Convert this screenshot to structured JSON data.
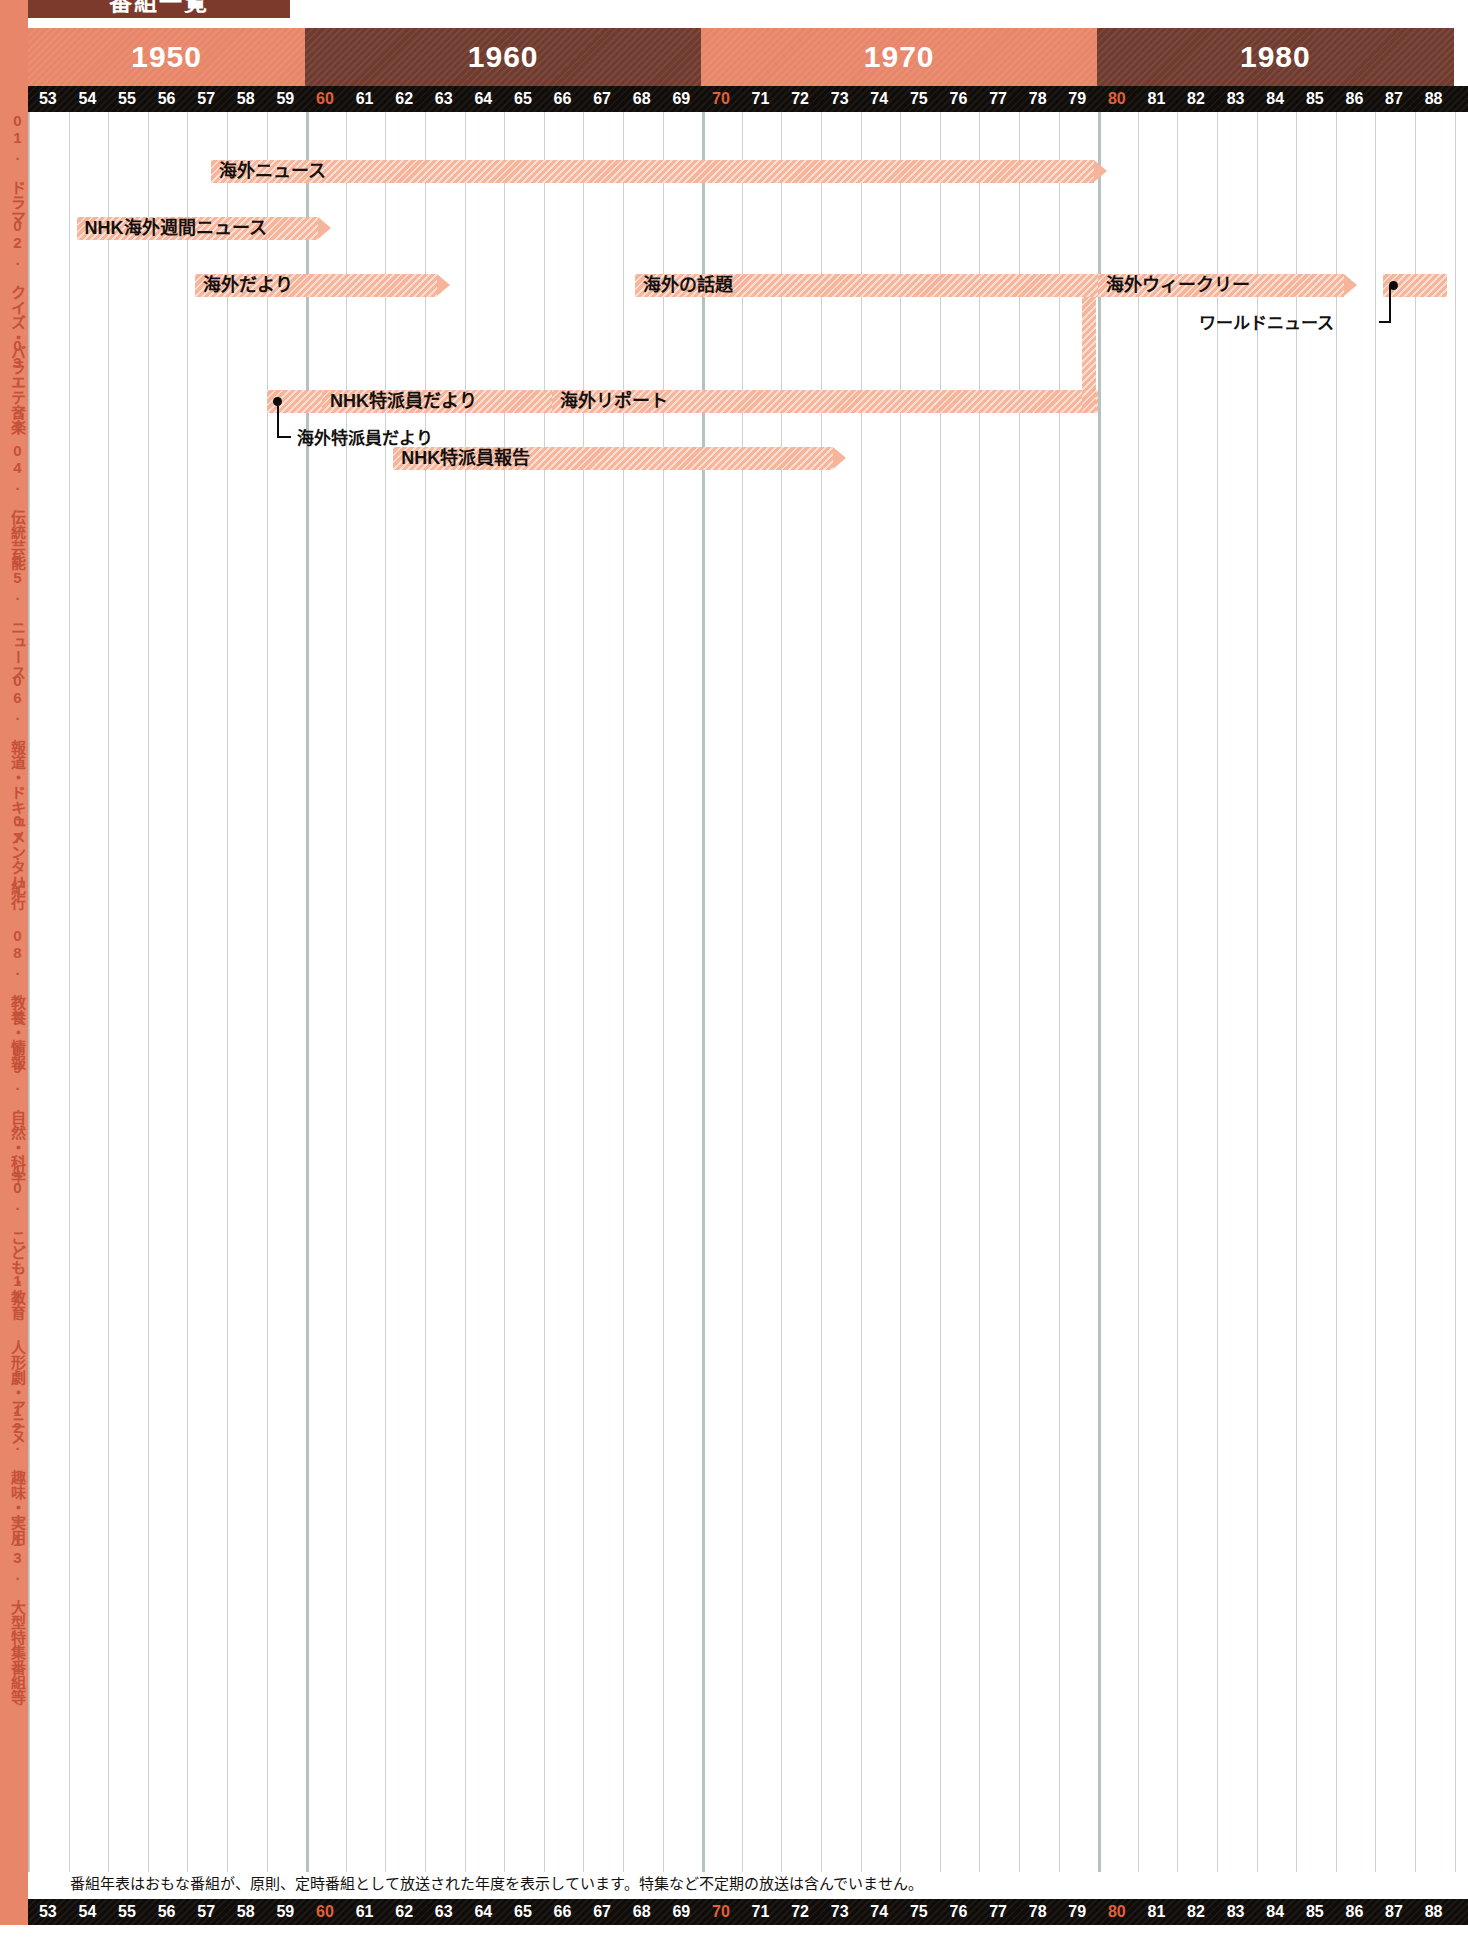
{
  "header": {
    "title": "番組一覧",
    "decades": [
      "1950",
      "1960",
      "1970",
      "1980"
    ],
    "highlight_color": "#e2603a",
    "band_color_a": "#e8866a",
    "band_color_b": "#6f3b2e"
  },
  "axis": {
    "years": [
      "53",
      "54",
      "55",
      "56",
      "57",
      "58",
      "59",
      "60",
      "61",
      "62",
      "63",
      "64",
      "65",
      "66",
      "67",
      "68",
      "69",
      "70",
      "71",
      "72",
      "73",
      "74",
      "75",
      "76",
      "77",
      "78",
      "79",
      "80",
      "81",
      "82",
      "83",
      "84",
      "85",
      "86",
      "87",
      "88"
    ],
    "highlighted": [
      "60",
      "70",
      "80"
    ]
  },
  "sidebar": {
    "items": [
      {
        "label": "01. ドラマ"
      },
      {
        "label": "02. クイズ・バラエティー"
      },
      {
        "label": "03. 音楽"
      },
      {
        "label": "04. 伝統芸能"
      },
      {
        "label": "05. ニュース"
      },
      {
        "label": "06. 報道・ドキュメンタリー"
      },
      {
        "label": "07. 紀行"
      },
      {
        "label": "08. 教養・情報"
      },
      {
        "label": "09. 自然・科学"
      },
      {
        "label": "10. こども・教育"
      },
      {
        "label": "11. 人形劇・アニメ"
      },
      {
        "label": "12. 趣味・実用"
      },
      {
        "label": "13. 大型特集番組等"
      }
    ]
  },
  "chart_data": {
    "type": "bar",
    "title": "番組一覧",
    "xlabel": "",
    "ylabel": "",
    "x_range": [
      1953,
      1988
    ],
    "grid": true,
    "legend": "none",
    "bar_color": "#f6b49a",
    "series": [
      {
        "name": "海外ニュース",
        "start": 1957.6,
        "end": 1979.9,
        "row": 1,
        "arrow": true,
        "label_inside": true
      },
      {
        "name": "NHK海外週間ニュース",
        "start": 1954.2,
        "end": 1960.3,
        "row": 2,
        "arrow": true,
        "label_inside": true
      },
      {
        "name": "海外だより",
        "start": 1957.2,
        "end": 1963.3,
        "row": 3,
        "arrow": true,
        "label_inside": true
      },
      {
        "name": "海外の話題",
        "start": 1968.3,
        "end": 1980.0,
        "row": 3,
        "arrow": false,
        "label_inside": true
      },
      {
        "name": "海外ウィークリー",
        "start": 1980.0,
        "end": 1986.2,
        "row": 3,
        "arrow": true,
        "label_inside": true
      },
      {
        "name": "ワールドニュース",
        "start": 1987.2,
        "end": 1988.8,
        "row": 3,
        "arrow": false,
        "label_inside": false,
        "dot": true
      },
      {
        "name": "海外特派員だより",
        "start": 1959.0,
        "end": 1960.4,
        "row": 6,
        "arrow": true,
        "label_inside": false,
        "dot": true
      },
      {
        "name": "NHK特派員だより",
        "start": 1960.4,
        "end": 1966.2,
        "row": 6,
        "arrow": true,
        "label_inside": true
      },
      {
        "name": "海外リポート",
        "start": 1966.2,
        "end": 1980.0,
        "row": 6,
        "arrow": false,
        "label_inside": true
      },
      {
        "name": "NHK特派員報告",
        "start": 1962.2,
        "end": 1973.3,
        "row": 7,
        "arrow": true,
        "label_inside": true
      }
    ],
    "connectors": [
      {
        "from": "海外の話題",
        "to": "海外リポート",
        "at_year": 1979.6
      }
    ],
    "callouts": [
      {
        "label": "ワールドニュース",
        "anchor_year": 1987.2
      },
      {
        "label": "海外特派員だより",
        "anchor_year": 1959.0
      }
    ]
  },
  "footer": {
    "note": "番組年表はおもな番組が、原則、定時番組として放送された年度を表示しています。特集など不定期の放送は含んでいません。"
  }
}
